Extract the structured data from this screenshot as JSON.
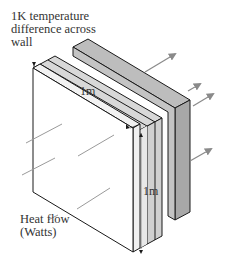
{
  "diagram": {
    "labels": {
      "temperature_line1": "1K temperature",
      "temperature_line2": "difference across",
      "temperature_line3": "wall",
      "width": "1m",
      "height": "1m",
      "heat_line1": "Heat flow",
      "heat_line2": "(Watts)"
    },
    "colors": {
      "front_face": "#ffffff",
      "outline": "#1a1a1a",
      "layer_light": "#e6e6e6",
      "layer_mid": "#cfcfcf",
      "layer_dark": "#b5b5b5",
      "back_slab_top": "#bdbdbd",
      "back_slab_side": "#a8a8a8",
      "arrow": "#8a8a8a",
      "heat_lines": "#9a9a9a",
      "text": "#333333"
    },
    "components": [
      "wall-layers",
      "air-gap",
      "outer-leaf",
      "heat-flow-arrows",
      "dimension-markers"
    ]
  }
}
